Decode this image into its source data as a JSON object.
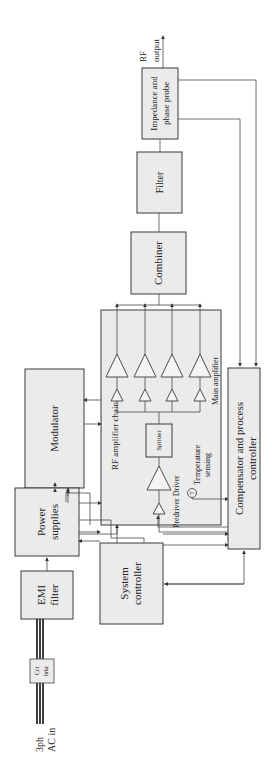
{
  "diagram": {
    "orientation": "rotated 90 degrees counter-clockwise",
    "blocks": {
      "impedance_probe": {
        "line1": "Impedance and",
        "line2": "phase probe"
      },
      "filter": {
        "label": "Filter"
      },
      "combiner": {
        "label": "Combiner"
      },
      "rf_chain": {
        "label": "RF amplifier chain"
      },
      "splitter": {
        "label": "Splitter"
      },
      "modulator": {
        "label": "Modulator"
      },
      "compensator": {
        "line1": "Compensator and process",
        "line2": "controller"
      },
      "power_supplies": {
        "line1": "Power",
        "line2": "supplies"
      },
      "system_controller": {
        "line1": "System",
        "line2": "controller"
      },
      "emi_filter": {
        "line1": "EMI",
        "line2": "filter"
      },
      "circuit_breaker": {
        "line1": "Cct",
        "line2": "brkr"
      }
    },
    "labels": {
      "rf_output_1": "RF",
      "rf_output_2": "output",
      "ac_in_1": "3ph",
      "ac_in_2": "AC in",
      "predriver_driver": "Predriver Driver",
      "temp_1": "Temperature",
      "temp_2": "sensing",
      "temp_symbol": "T",
      "main_amplifier": "Main amplifier"
    },
    "main_amplifier_count": 4
  }
}
